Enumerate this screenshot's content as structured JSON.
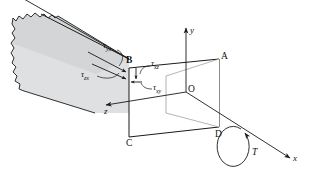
{
  "figure": {
    "type": "engineering-diagram",
    "colors": {
      "line": "#1a1a1a",
      "top_face_fill": "#d2d4d6",
      "side_face_fill": "#e2e3e5",
      "front_face_fill": "#ffffff",
      "background": "#ffffff"
    }
  },
  "vertices": {
    "a": "A",
    "b": "B",
    "c": "C",
    "d": "D",
    "o": "O"
  },
  "axes": {
    "x": "x",
    "y": "y",
    "z": "z"
  },
  "loads": {
    "torque": "T"
  },
  "stresses": {
    "tau_yx": {
      "symbol": "τ",
      "sub": "yx"
    },
    "tau_zx": {
      "symbol": "τ",
      "sub": "zx"
    },
    "tau_xz": {
      "symbol": "τ",
      "sub": "xz"
    },
    "tau_xy": {
      "symbol": "τ",
      "sub": "xy"
    }
  }
}
